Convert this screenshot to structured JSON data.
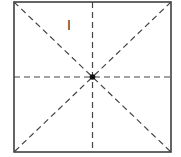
{
  "diagram": {
    "type": "square-with-symmetry-lines",
    "square": {
      "x1": 14,
      "y1": 2,
      "x2": 171,
      "y2": 152,
      "stroke": "#333333"
    },
    "center": {
      "x": 92.5,
      "y": 77
    },
    "dashed_lines": [
      "vertical",
      "horizontal",
      "diagonal-main",
      "diagonal-anti"
    ],
    "dash_color": "#444444",
    "label": {
      "text": "I",
      "x": 70,
      "y": 30
    }
  }
}
